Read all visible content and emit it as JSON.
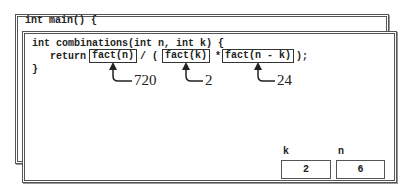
{
  "outer_frame": {
    "code_line": "int main() {"
  },
  "inner_frame": {
    "signature": "int combinations(int n, int k) {",
    "return_keyword": "return",
    "call_1": "fact(n)",
    "divide_op": "/ (",
    "call_2": "fact(k)",
    "multiply_op": "*",
    "call_3": "fact(n - k)",
    "closing": ");",
    "close_brace": "}"
  },
  "annotations": [
    {
      "call": "fact(n)",
      "value": "720"
    },
    {
      "call": "fact(k)",
      "value": "2"
    },
    {
      "call": "fact(n - k)",
      "value": "24"
    }
  ],
  "variables": [
    {
      "name": "k",
      "value": "2"
    },
    {
      "name": "n",
      "value": "6"
    }
  ]
}
